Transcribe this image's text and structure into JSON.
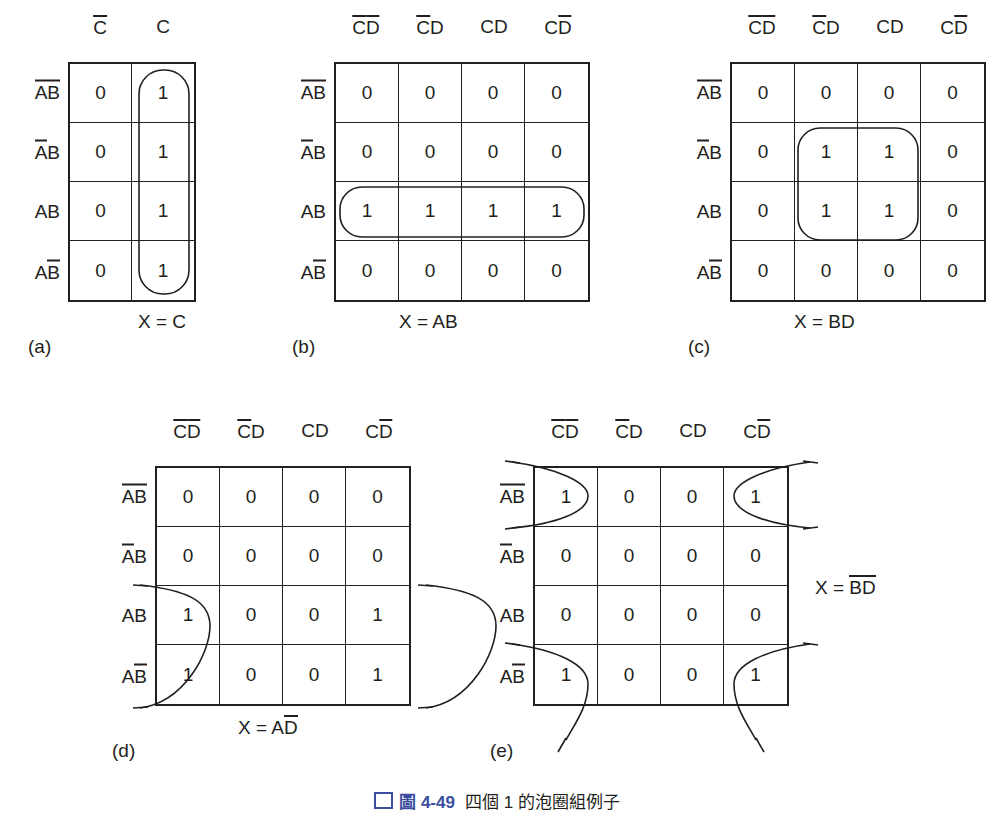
{
  "figure": {
    "caption_number": "圖 4-49",
    "caption_text": "四個 1 的泡圈組例子"
  },
  "maps": [
    {
      "id": "a",
      "part_label": "(a)",
      "result": "X = C",
      "col_headers": [
        {
          "terms": [
            {
              "t": "C",
              "bar": true
            }
          ]
        },
        {
          "terms": [
            {
              "t": "C",
              "bar": false
            }
          ]
        }
      ],
      "row_headers": [
        {
          "terms": [
            {
              "t": "A",
              "bar": true
            },
            {
              "t": "B",
              "bar": true
            }
          ]
        },
        {
          "terms": [
            {
              "t": "A",
              "bar": true
            },
            {
              "t": "B",
              "bar": false
            }
          ]
        },
        {
          "terms": [
            {
              "t": "A",
              "bar": false
            },
            {
              "t": "B",
              "bar": false
            }
          ]
        },
        {
          "terms": [
            {
              "t": "A",
              "bar": false
            },
            {
              "t": "B",
              "bar": true
            }
          ]
        }
      ],
      "values": [
        [
          "0",
          "1"
        ],
        [
          "0",
          "1"
        ],
        [
          "0",
          "1"
        ],
        [
          "0",
          "1"
        ]
      ],
      "group_type": "column",
      "group_note": "vertical bubble over all four 1s in the C column"
    },
    {
      "id": "b",
      "part_label": "(b)",
      "result": "X = AB",
      "col_headers": [
        {
          "terms": [
            {
              "t": "C",
              "bar": true
            },
            {
              "t": "D",
              "bar": true
            }
          ]
        },
        {
          "terms": [
            {
              "t": "C",
              "bar": true
            },
            {
              "t": "D",
              "bar": false
            }
          ]
        },
        {
          "terms": [
            {
              "t": "C",
              "bar": false
            },
            {
              "t": "D",
              "bar": false
            }
          ]
        },
        {
          "terms": [
            {
              "t": "C",
              "bar": false
            },
            {
              "t": "D",
              "bar": true
            }
          ]
        }
      ],
      "row_headers": [
        {
          "terms": [
            {
              "t": "A",
              "bar": true
            },
            {
              "t": "B",
              "bar": true
            }
          ]
        },
        {
          "terms": [
            {
              "t": "A",
              "bar": true
            },
            {
              "t": "B",
              "bar": false
            }
          ]
        },
        {
          "terms": [
            {
              "t": "A",
              "bar": false
            },
            {
              "t": "B",
              "bar": false
            }
          ]
        },
        {
          "terms": [
            {
              "t": "A",
              "bar": false
            },
            {
              "t": "B",
              "bar": true
            }
          ]
        }
      ],
      "values": [
        [
          "0",
          "0",
          "0",
          "0"
        ],
        [
          "0",
          "0",
          "0",
          "0"
        ],
        [
          "1",
          "1",
          "1",
          "1"
        ],
        [
          "0",
          "0",
          "0",
          "0"
        ]
      ],
      "group_type": "row",
      "group_note": "horizontal bubble over the four 1s in the AB row"
    },
    {
      "id": "c",
      "part_label": "(c)",
      "result": "X = BD",
      "col_headers": [
        {
          "terms": [
            {
              "t": "C",
              "bar": true
            },
            {
              "t": "D",
              "bar": true
            }
          ]
        },
        {
          "terms": [
            {
              "t": "C",
              "bar": true
            },
            {
              "t": "D",
              "bar": false
            }
          ]
        },
        {
          "terms": [
            {
              "t": "C",
              "bar": false
            },
            {
              "t": "D",
              "bar": false
            }
          ]
        },
        {
          "terms": [
            {
              "t": "C",
              "bar": false
            },
            {
              "t": "D",
              "bar": true
            }
          ]
        }
      ],
      "row_headers": [
        {
          "terms": [
            {
              "t": "A",
              "bar": true
            },
            {
              "t": "B",
              "bar": true
            }
          ]
        },
        {
          "terms": [
            {
              "t": "A",
              "bar": true
            },
            {
              "t": "B",
              "bar": false
            }
          ]
        },
        {
          "terms": [
            {
              "t": "A",
              "bar": false
            },
            {
              "t": "B",
              "bar": false
            }
          ]
        },
        {
          "terms": [
            {
              "t": "A",
              "bar": false
            },
            {
              "t": "B",
              "bar": true
            }
          ]
        }
      ],
      "values": [
        [
          "0",
          "0",
          "0",
          "0"
        ],
        [
          "0",
          "1",
          "1",
          "0"
        ],
        [
          "0",
          "1",
          "1",
          "0"
        ],
        [
          "0",
          "0",
          "0",
          "0"
        ]
      ],
      "group_type": "square",
      "group_note": "2x2 bubble over middle rows, middle columns"
    },
    {
      "id": "d",
      "part_label": "(d)",
      "result_prefix": "X = A",
      "result_bar": "D",
      "col_headers": [
        {
          "terms": [
            {
              "t": "C",
              "bar": true
            },
            {
              "t": "D",
              "bar": true
            }
          ]
        },
        {
          "terms": [
            {
              "t": "C",
              "bar": true
            },
            {
              "t": "D",
              "bar": false
            }
          ]
        },
        {
          "terms": [
            {
              "t": "C",
              "bar": false
            },
            {
              "t": "D",
              "bar": false
            }
          ]
        },
        {
          "terms": [
            {
              "t": "C",
              "bar": false
            },
            {
              "t": "D",
              "bar": true
            }
          ]
        }
      ],
      "row_headers": [
        {
          "terms": [
            {
              "t": "A",
              "bar": true
            },
            {
              "t": "B",
              "bar": true
            }
          ]
        },
        {
          "terms": [
            {
              "t": "A",
              "bar": true
            },
            {
              "t": "B",
              "bar": false
            }
          ]
        },
        {
          "terms": [
            {
              "t": "A",
              "bar": false
            },
            {
              "t": "B",
              "bar": false
            }
          ]
        },
        {
          "terms": [
            {
              "t": "A",
              "bar": false
            },
            {
              "t": "B",
              "bar": true
            }
          ]
        }
      ],
      "values": [
        [
          "0",
          "0",
          "0",
          "0"
        ],
        [
          "0",
          "0",
          "0",
          "0"
        ],
        [
          "1",
          "0",
          "0",
          "1"
        ],
        [
          "1",
          "0",
          "0",
          "1"
        ]
      ],
      "group_type": "side-wrap",
      "group_note": "wrap-around bubble joining first and last columns of the two bottom rows"
    },
    {
      "id": "e",
      "part_label": "(e)",
      "result_prefix": "X = ",
      "result_bar_b": "B",
      "result_bar_d": "D",
      "col_headers": [
        {
          "terms": [
            {
              "t": "C",
              "bar": true
            },
            {
              "t": "D",
              "bar": true
            }
          ]
        },
        {
          "terms": [
            {
              "t": "C",
              "bar": true
            },
            {
              "t": "D",
              "bar": false
            }
          ]
        },
        {
          "terms": [
            {
              "t": "C",
              "bar": false
            },
            {
              "t": "D",
              "bar": false
            }
          ]
        },
        {
          "terms": [
            {
              "t": "C",
              "bar": false
            },
            {
              "t": "D",
              "bar": true
            }
          ]
        }
      ],
      "row_headers": [
        {
          "terms": [
            {
              "t": "A",
              "bar": true
            },
            {
              "t": "B",
              "bar": true
            }
          ]
        },
        {
          "terms": [
            {
              "t": "A",
              "bar": true
            },
            {
              "t": "B",
              "bar": false
            }
          ]
        },
        {
          "terms": [
            {
              "t": "A",
              "bar": false
            },
            {
              "t": "B",
              "bar": false
            }
          ]
        },
        {
          "terms": [
            {
              "t": "A",
              "bar": false
            },
            {
              "t": "B",
              "bar": true
            }
          ]
        }
      ],
      "values": [
        [
          "1",
          "0",
          "0",
          "1"
        ],
        [
          "0",
          "0",
          "0",
          "0"
        ],
        [
          "0",
          "0",
          "0",
          "0"
        ],
        [
          "1",
          "0",
          "0",
          "1"
        ]
      ],
      "group_type": "corner-wrap",
      "group_note": "four corner cells grouped with wrap-around bubbles"
    }
  ]
}
